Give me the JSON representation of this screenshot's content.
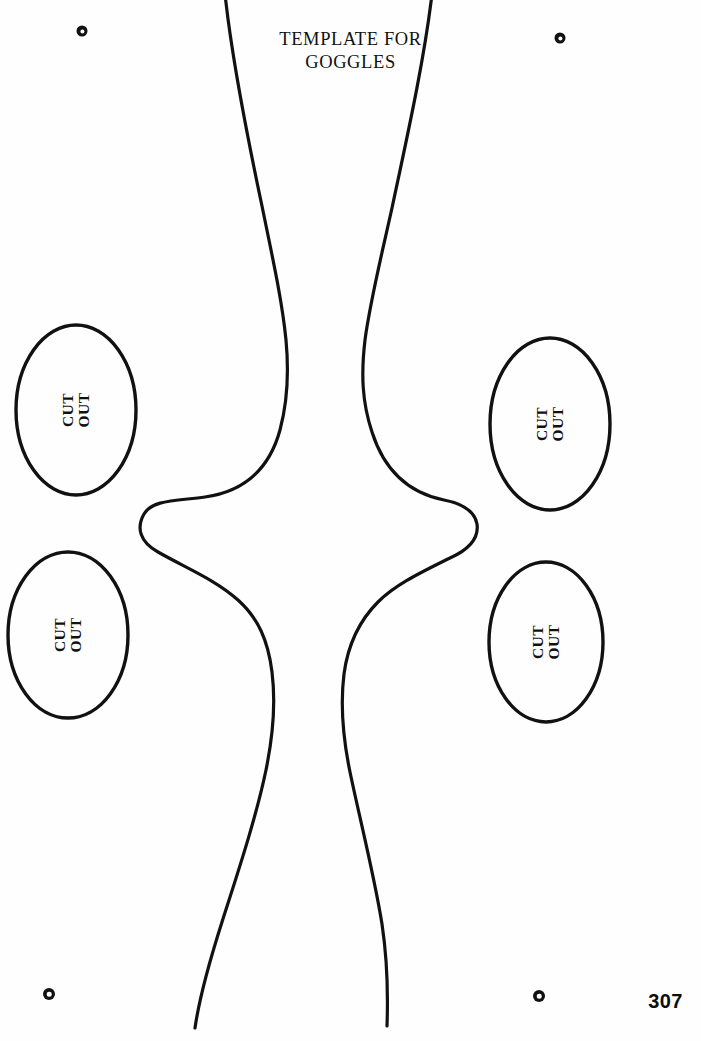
{
  "page": {
    "width": 701,
    "height": 1041,
    "background_color": "#fefefe",
    "ink_color": "#111111",
    "page_number": "307"
  },
  "title": {
    "line1": "TEMPLATE FOR",
    "line2": "GOGGLES"
  },
  "cutouts": [
    {
      "id": "upper-left",
      "label_line1": "CUT",
      "label_line2": "OUT",
      "center_x": 76,
      "center_y": 410,
      "rx": 60,
      "ry": 85
    },
    {
      "id": "upper-right",
      "label_line1": "CUT",
      "label_line2": "OUT",
      "center_x": 550,
      "center_y": 424,
      "rx": 60,
      "ry": 86
    },
    {
      "id": "lower-left",
      "label_line1": "CUT",
      "label_line2": "OUT",
      "center_x": 68,
      "center_y": 635,
      "rx": 60,
      "ry": 83
    },
    {
      "id": "lower-right",
      "label_line1": "CUT",
      "label_line2": "OUT",
      "center_x": 546,
      "center_y": 642,
      "rx": 57,
      "ry": 80
    }
  ],
  "registration_marks": [
    {
      "id": "top-left",
      "x": 82,
      "y": 31,
      "size": 11
    },
    {
      "id": "top-right",
      "x": 560,
      "y": 38,
      "size": 11
    },
    {
      "id": "bottom-left",
      "x": 49,
      "y": 994,
      "size": 12
    },
    {
      "id": "bottom-right",
      "x": 539,
      "y": 996,
      "size": 12
    }
  ],
  "goggle_outline": {
    "stroke_width": 3.2,
    "left_contour": "M 225 -6 C 232 60 248 140 262 206 C 273 260 282 300 286 340 C 289 372 288 400 280 430 C 268 474 240 492 205 497 C 175 501 152 500 144 514 C 136 528 140 542 158 552 C 186 568 216 580 238 600 C 258 618 268 640 272 672 C 276 704 273 736 266 770 C 256 818 238 872 222 922 C 208 966 199 1000 195 1028",
    "right_contour": "M 432 -6 C 424 62 406 142 392 208 C 380 262 370 302 365 340 C 361 374 362 402 372 432 C 386 476 414 494 444 500 C 464 504 475 512 477 524 C 479 538 470 549 450 558 C 422 572 396 584 378 602 C 360 620 348 644 344 674 C 340 706 343 738 350 772 C 360 820 374 874 382 924 C 388 964 388 998 387 1026"
  }
}
